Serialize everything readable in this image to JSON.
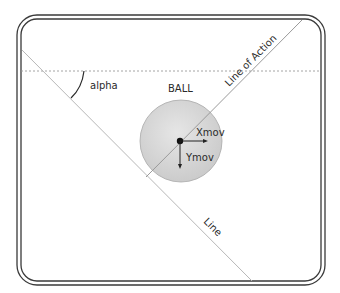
{
  "diagram": {
    "labels": {
      "alpha": "alpha",
      "ball": "BALL",
      "line_of_action": "Line of Action",
      "line": "Line",
      "xmov": "Xmov",
      "ymov": "Ymov"
    },
    "colors": {
      "frame": "#3a3a3a",
      "line": "#b5b5b5",
      "dashed": "#9a9a9a",
      "ball_fill": "#d6d6d6",
      "ball_stroke": "#a8a8a8",
      "vector": "#222222"
    }
  }
}
